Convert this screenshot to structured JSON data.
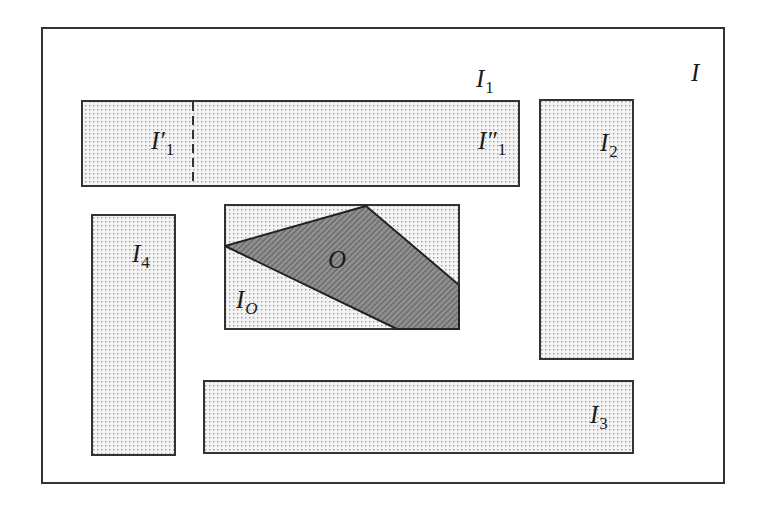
{
  "diagram": {
    "type": "region-partition",
    "colors": {
      "background": "#ffffff",
      "stroke": "#333333",
      "region_fill": "#eeeeee",
      "dot_color": "#9a9a9a",
      "object_fill": "#8a8a8a",
      "hatch_color": "#555555"
    },
    "frame": {
      "x": 42,
      "y": 28,
      "w": 682,
      "h": 455,
      "label": {
        "main": "I",
        "sub": ""
      }
    },
    "regions": [
      {
        "id": "I1",
        "x": 82,
        "y": 101,
        "w": 437,
        "h": 85,
        "label": {
          "main": "I",
          "sub": "1"
        }
      },
      {
        "id": "I2",
        "x": 540,
        "y": 100,
        "w": 93,
        "h": 259,
        "label": {
          "main": "I",
          "sub": "2"
        }
      },
      {
        "id": "I3",
        "x": 204,
        "y": 381,
        "w": 429,
        "h": 72,
        "label": {
          "main": "I",
          "sub": "3"
        }
      },
      {
        "id": "I4",
        "x": 92,
        "y": 215,
        "w": 83,
        "h": 240,
        "label": {
          "main": "I",
          "sub": "4"
        }
      },
      {
        "id": "IO",
        "x": 225,
        "y": 205,
        "w": 234,
        "h": 124,
        "label": {
          "main": "I",
          "sub": "O"
        }
      }
    ],
    "sub_regions": [
      {
        "id": "I1_prime",
        "label": {
          "main": "I′",
          "sub": "1"
        }
      },
      {
        "id": "I1_double_prime",
        "label": {
          "main": "I″",
          "sub": "1"
        }
      }
    ],
    "divider": {
      "x": 193,
      "y1": 101,
      "y2": 186,
      "style": "dashed"
    },
    "object": {
      "label": "O",
      "points": [
        [
          225,
          246
        ],
        [
          366,
          206
        ],
        [
          459,
          285
        ],
        [
          459,
          329
        ],
        [
          397,
          329
        ]
      ]
    }
  }
}
